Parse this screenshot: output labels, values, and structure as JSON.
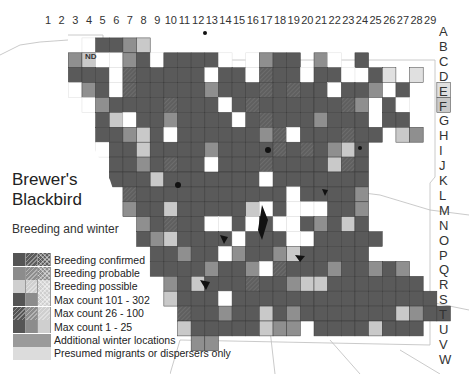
{
  "title_line1": "Brewer's",
  "title_line2": "Blackbird",
  "subtitle": "Breeding and winter",
  "nd_label": "ND",
  "columns": [
    "1",
    "2",
    "3",
    "4",
    "5",
    "6",
    "7",
    "8",
    "9",
    "10",
    "11",
    "12",
    "13",
    "14",
    "15",
    "16",
    "17",
    "18",
    "19",
    "20",
    "21",
    "22",
    "23",
    "24",
    "25",
    "26",
    "27",
    "28",
    "29"
  ],
  "rows": [
    "A",
    "B",
    "C",
    "D",
    "E",
    "F",
    "G",
    "H",
    "I",
    "J",
    "K",
    "L",
    "M",
    "N",
    "O",
    "P",
    "Q",
    "R",
    "S",
    "T",
    "U",
    "V",
    "W"
  ],
  "colors": {
    "D": "#5a5a5a",
    "H": "#5f5f5f",
    "M": "#8f8f8f",
    "L": "#c9c9c9",
    "P": "#e0e0e0",
    "X": "#a8a8a8",
    "border": "#3a3a3a"
  },
  "legend": [
    {
      "label": "Breeding confirmed",
      "swatch": [
        "#555555",
        "#5c5c5c:hatch",
        "#5c5c5c:cross"
      ]
    },
    {
      "label": "Breeding probable",
      "swatch": [
        "#8c8c8c",
        "#8c8c8c:hatch",
        "#8c8c8c:cross"
      ]
    },
    {
      "label": "Breeding possible",
      "swatch": [
        "#cfcfcf",
        "#cfcfcf:hatch",
        "#cfcfcf:cross"
      ]
    },
    {
      "label": "Max count 101 - 302",
      "swatch": [
        "#555555",
        "#8c8c8c",
        "#cfcfcf:cross"
      ]
    },
    {
      "label": "Max count 26 - 100",
      "swatch": [
        "#555555:hatch",
        "#8c8c8c:hatch",
        "#cfcfcf:hatch"
      ]
    },
    {
      "label": "Max count 1 - 25",
      "swatch": [
        "#555555",
        "#8c8c8c",
        "#cfcfcf"
      ]
    },
    {
      "label": "Additional winter locations",
      "swatch": [
        "#9a9a9a"
      ],
      "full": true
    },
    {
      "label": "Presumed migrants or dispersers only",
      "swatch": [
        "#dcdcdc"
      ],
      "full": true
    }
  ],
  "grid": {
    "origin_x": 41,
    "origin_y": 23,
    "cell_w": 13.65,
    "cell_h": 14.9,
    "cells": [
      "..............................",
      "...WDDML......................",
      "..MLWWMDWDDDDW.WMDD.MW.D......",
      "..DDDWHDDDDDWDDWHDDWDDW.DP.P..",
      "..WMDWHDDDDDMDDDHDHDDWDDM.D..P",
      "...WMDDDDHDDDWDHDDDDDDHM.DW..L",
      "....DLWDDMDDDDWDHDDDMDDD.DD...",
      "....DDMLDWDDDDDDMHWDDDHDD.LM..",
      "....WDDLDDDDMDDDDHDHDMLD......",
      ".....DDMDHDDWDDDHDDDDLHD......",
      ".....DDDLDDDDDDDWDDDDDDD......",
      "......HDDDDDDDDDDDWDDDDM......",
      "......MDDLDDDDDLWDWWWDDM......",
      ".......MDHDDWWDWDWWDMDLD......",
      ".......DMLDDDDWDDDWWDDDDD.....",
      "........DDMDDWMDDMLDDDDD.....",
      "........DDDDMDDMWHDDDMDDMDM..",
      ".........MDLDDDHDDMLLDDDDDDD.",
      ".........LDDDWDDDDDDDDDDDDDDD.",
      "..........HDDMDDLDMDDDDDDDLMDD",
      "..........LDDDDDLMM.DDDDLDDD.",
      "...........MM.................",
      ".............................."
    ]
  }
}
